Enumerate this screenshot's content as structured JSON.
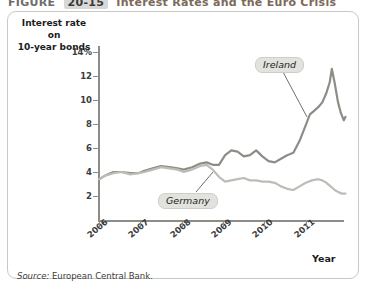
{
  "header": {
    "prefix": "FIGURE",
    "number": "20-15",
    "title": "Interest Rates and the Euro Crisis"
  },
  "axes": {
    "y_title_line1": "Interest rate on",
    "y_title_line2": "10-year bonds",
    "x_title": "Year",
    "y_ticks": [
      "14%",
      "12",
      "10",
      "8",
      "6",
      "4",
      "2"
    ],
    "y_tick_values": [
      14,
      12,
      10,
      8,
      6,
      4,
      2
    ],
    "x_ticks": [
      "2006",
      "2007",
      "2008",
      "2009",
      "2010",
      "2011"
    ]
  },
  "labels": {
    "ireland": "Ireland",
    "germany": "Germany"
  },
  "source": {
    "keyword": "Source:",
    "text": " European Central Bank."
  },
  "colors": {
    "ireland_line": "#8d8d88",
    "germany_line": "#bdbdb8",
    "axis": "#8d8d88",
    "panel_border": "#c9c9c4",
    "tag_bg": "#e2e2de"
  },
  "chart_data": {
    "type": "line",
    "title": "Interest Rates and the Euro Crisis",
    "xlabel": "Year",
    "ylabel": "Interest rate on 10-year bonds",
    "ylim": [
      0,
      15
    ],
    "xlim": [
      2006,
      2011.9
    ],
    "grid": false,
    "legend": "inline-annotations",
    "series": [
      {
        "name": "Ireland",
        "color": "#8d8d88",
        "points": [
          [
            2006.0,
            3.4
          ],
          [
            2006.15,
            3.7
          ],
          [
            2006.35,
            4.0
          ],
          [
            2006.55,
            4.0
          ],
          [
            2006.75,
            3.9
          ],
          [
            2006.95,
            3.9
          ],
          [
            2007.1,
            4.1
          ],
          [
            2007.3,
            4.3
          ],
          [
            2007.5,
            4.5
          ],
          [
            2007.7,
            4.4
          ],
          [
            2007.9,
            4.3
          ],
          [
            2008.05,
            4.2
          ],
          [
            2008.25,
            4.4
          ],
          [
            2008.45,
            4.7
          ],
          [
            2008.6,
            4.8
          ],
          [
            2008.75,
            4.6
          ],
          [
            2008.9,
            4.6
          ],
          [
            2009.05,
            5.4
          ],
          [
            2009.2,
            5.8
          ],
          [
            2009.35,
            5.7
          ],
          [
            2009.5,
            5.3
          ],
          [
            2009.65,
            5.4
          ],
          [
            2009.8,
            5.8
          ],
          [
            2009.95,
            5.3
          ],
          [
            2010.1,
            4.9
          ],
          [
            2010.25,
            4.8
          ],
          [
            2010.4,
            5.1
          ],
          [
            2010.55,
            5.4
          ],
          [
            2010.7,
            5.6
          ],
          [
            2010.85,
            6.6
          ],
          [
            2011.0,
            7.9
          ],
          [
            2011.1,
            8.8
          ],
          [
            2011.2,
            9.1
          ],
          [
            2011.3,
            9.4
          ],
          [
            2011.4,
            9.8
          ],
          [
            2011.5,
            10.6
          ],
          [
            2011.58,
            11.5
          ],
          [
            2011.63,
            12.6
          ],
          [
            2011.7,
            11.4
          ],
          [
            2011.78,
            9.8
          ],
          [
            2011.85,
            8.9
          ],
          [
            2011.92,
            8.3
          ],
          [
            2011.96,
            8.6
          ]
        ]
      },
      {
        "name": "Germany",
        "color": "#bdbdb8",
        "points": [
          [
            2006.0,
            3.4
          ],
          [
            2006.15,
            3.7
          ],
          [
            2006.35,
            3.9
          ],
          [
            2006.55,
            4.0
          ],
          [
            2006.75,
            3.8
          ],
          [
            2006.95,
            3.9
          ],
          [
            2007.1,
            4.0
          ],
          [
            2007.3,
            4.2
          ],
          [
            2007.5,
            4.4
          ],
          [
            2007.7,
            4.3
          ],
          [
            2007.9,
            4.2
          ],
          [
            2008.05,
            4.0
          ],
          [
            2008.25,
            4.2
          ],
          [
            2008.45,
            4.5
          ],
          [
            2008.6,
            4.6
          ],
          [
            2008.75,
            4.2
          ],
          [
            2008.9,
            3.6
          ],
          [
            2009.05,
            3.2
          ],
          [
            2009.2,
            3.3
          ],
          [
            2009.35,
            3.4
          ],
          [
            2009.5,
            3.5
          ],
          [
            2009.65,
            3.3
          ],
          [
            2009.8,
            3.3
          ],
          [
            2009.95,
            3.2
          ],
          [
            2010.1,
            3.2
          ],
          [
            2010.25,
            3.1
          ],
          [
            2010.4,
            2.8
          ],
          [
            2010.55,
            2.6
          ],
          [
            2010.7,
            2.5
          ],
          [
            2010.85,
            2.8
          ],
          [
            2011.0,
            3.1
          ],
          [
            2011.15,
            3.3
          ],
          [
            2011.3,
            3.4
          ],
          [
            2011.4,
            3.3
          ],
          [
            2011.5,
            3.1
          ],
          [
            2011.6,
            2.8
          ],
          [
            2011.7,
            2.5
          ],
          [
            2011.8,
            2.3
          ],
          [
            2011.88,
            2.2
          ],
          [
            2011.96,
            2.2
          ]
        ]
      }
    ],
    "annotations": [
      {
        "text": "Ireland",
        "x": 2011.0,
        "y": 13.9
      },
      {
        "text": "Germany",
        "x": 2008.3,
        "y": 2.6
      }
    ]
  }
}
